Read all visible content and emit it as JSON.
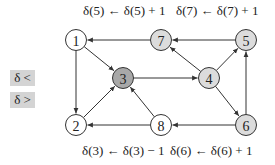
{
  "equations": {
    "top_left": "δ(5) ← δ(5) + 1",
    "top_right": "δ(7) ← δ(7) + 1",
    "bottom_left": "δ(3) ← δ(3) − 1",
    "bottom_right": "δ(6) ← δ(6) + 1"
  },
  "buttons": {
    "less": "δ <",
    "greater": "δ >"
  },
  "colors": {
    "white_node": "#ffffff",
    "light_node": "#dcdcdc",
    "dark_node": "#a8a8a8",
    "edge": "#333333"
  },
  "graph": {
    "nodes": [
      {
        "id": "1",
        "label": "1",
        "shade": "white"
      },
      {
        "id": "7",
        "label": "7",
        "shade": "light"
      },
      {
        "id": "5",
        "label": "5",
        "shade": "light"
      },
      {
        "id": "3",
        "label": "3",
        "shade": "dark"
      },
      {
        "id": "4",
        "label": "4",
        "shade": "light"
      },
      {
        "id": "2",
        "label": "2",
        "shade": "white"
      },
      {
        "id": "8",
        "label": "8",
        "shade": "white"
      },
      {
        "id": "6",
        "label": "6",
        "shade": "light"
      }
    ],
    "edges": [
      {
        "from": "7",
        "to": "1"
      },
      {
        "from": "5",
        "to": "7"
      },
      {
        "from": "1",
        "to": "3"
      },
      {
        "from": "1",
        "to": "2"
      },
      {
        "from": "3",
        "to": "4"
      },
      {
        "from": "4",
        "to": "7"
      },
      {
        "from": "4",
        "to": "5"
      },
      {
        "from": "4",
        "to": "6"
      },
      {
        "from": "2",
        "to": "3"
      },
      {
        "from": "8",
        "to": "3"
      },
      {
        "from": "8",
        "to": "2"
      },
      {
        "from": "6",
        "to": "8"
      },
      {
        "from": "6",
        "to": "5"
      }
    ]
  }
}
